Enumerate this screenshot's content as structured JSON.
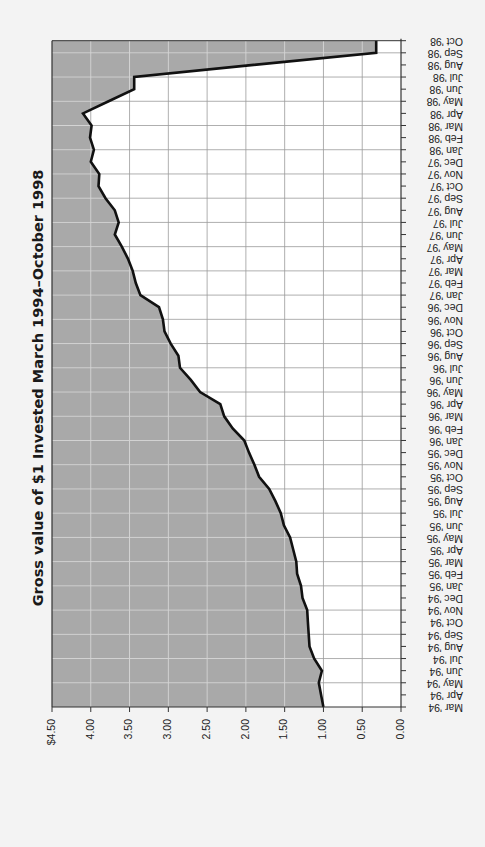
{
  "chart_data": {
    "type": "area",
    "title": "Gross value of $1 Invested March 1994–October 1998",
    "xlabel": "",
    "ylabel": "",
    "ylim": [
      0,
      4.5
    ],
    "grid": true,
    "legend": null,
    "orientation_note": "Figure is rotated 90° clockwise: time axis runs vertically on the right (Mar 94 at bottom, Oct 98 at top); value axis runs horizontally ($4.50 at left, 0.00 at right). Area between curve and $4.50 edge is shaded grey.",
    "y_tick_labels": [
      "$4.50",
      "4.00",
      "3.50",
      "3.00",
      "2.50",
      "2.00",
      "1.50",
      "1.00",
      "0.50",
      "0.00"
    ],
    "y_ticks": [
      4.5,
      4.0,
      3.5,
      3.0,
      2.5,
      2.0,
      1.5,
      1.0,
      0.5,
      0.0
    ],
    "categories": [
      "Mar '94",
      "Apr '94",
      "May '94",
      "Jun '94",
      "Jul '94",
      "Aug '94",
      "Sep '94",
      "Oct '94",
      "Nov '94",
      "Dec '94",
      "Jan '95",
      "Feb '95",
      "Mar '95",
      "Apr '95",
      "May '95",
      "Jun '95",
      "Jul '95",
      "Aug '95",
      "Sep '95",
      "Oct '95",
      "Nov '95",
      "Dec '95",
      "Jan '96",
      "Feb '96",
      "Mar '96",
      "Apr '96",
      "May '96",
      "Jun '96",
      "Jul '96",
      "Aug '96",
      "Sep '96",
      "Oct '96",
      "Nov '96",
      "Dec '96",
      "Jan '97",
      "Feb '97",
      "Mar '97",
      "Apr '97",
      "May '97",
      "Jun '97",
      "Jul '97",
      "Aug '97",
      "Sep '97",
      "Oct '97",
      "Nov '97",
      "Dec '97",
      "Jan '98",
      "Feb '98",
      "Mar '98",
      "Apr '98",
      "May '98",
      "Jun '98",
      "Jul '98",
      "Aug '98",
      "Sep '98",
      "Oct '98"
    ],
    "series": [
      {
        "name": "Gross value of $1",
        "values": [
          1.0,
          1.03,
          1.06,
          1.02,
          1.12,
          1.18,
          1.19,
          1.2,
          1.21,
          1.27,
          1.29,
          1.34,
          1.35,
          1.39,
          1.43,
          1.51,
          1.55,
          1.62,
          1.7,
          1.83,
          1.89,
          1.96,
          2.02,
          2.17,
          2.28,
          2.33,
          2.59,
          2.71,
          2.85,
          2.87,
          2.97,
          3.05,
          3.07,
          3.12,
          3.36,
          3.42,
          3.46,
          3.52,
          3.6,
          3.69,
          3.64,
          3.69,
          3.81,
          3.9,
          3.89,
          4.0,
          3.96,
          4.01,
          3.99,
          4.1,
          3.77,
          3.44,
          3.44,
          1.9,
          0.32,
          0.32
        ]
      }
    ]
  },
  "colors": {
    "background": "#f3f3f3",
    "plot_fill": "#a9a9a9",
    "plot_background": "#ffffff",
    "grid_on_fill": "#d4d4d4",
    "grid_on_white": "#9a9a9a",
    "line": "#111111",
    "axis": "#333333"
  }
}
